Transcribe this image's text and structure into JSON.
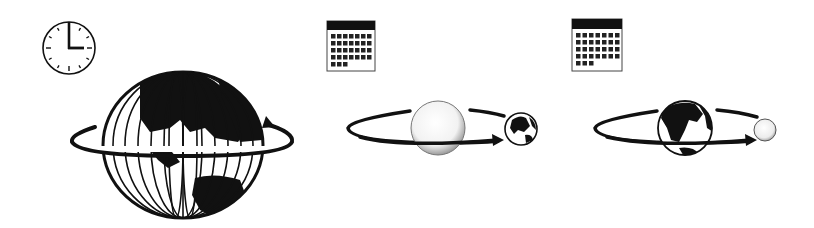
{
  "diagram": {
    "colors": {
      "ink": "#111111",
      "paper": "#ffffff",
      "sun_shade": "#bdbdbd",
      "moon_shade": "#cfcfcf"
    },
    "panels": [
      {
        "id": "day",
        "icon": "clock-icon",
        "clock_time": "3:00",
        "scene": "earth-rotation",
        "body": "Earth",
        "motion": "rotation arrow around equator"
      },
      {
        "id": "year",
        "icon": "calendar-icon",
        "calendar_rows": 5,
        "calendar_cols": 7,
        "calendar_days": 31,
        "scene": "earth-orbiting-sun",
        "central_body": "Sun",
        "orbiting_body": "Earth"
      },
      {
        "id": "month",
        "icon": "calendar-icon",
        "calendar_rows": 5,
        "calendar_cols": 7,
        "calendar_days": 31,
        "scene": "moon-orbiting-earth",
        "central_body": "Earth",
        "orbiting_body": "Moon"
      }
    ]
  }
}
